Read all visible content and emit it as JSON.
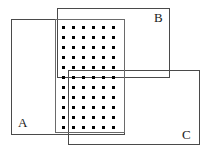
{
  "figure": {
    "width": 210,
    "height": 158,
    "background_color": "#ffffff",
    "stroke_color": "#4a4a4a",
    "dot_color": "#000000"
  },
  "rectangles": [
    {
      "id": "A",
      "label": "A",
      "x": 11,
      "y": 19,
      "width": 114,
      "height": 116,
      "label_x": 18,
      "label_y": 116
    },
    {
      "id": "B",
      "label": "B",
      "x": 57,
      "y": 8,
      "width": 113,
      "height": 70,
      "label_x": 154,
      "label_y": 11
    },
    {
      "id": "C",
      "label": "C",
      "x": 68,
      "y": 70,
      "width": 132,
      "height": 75,
      "label_x": 182,
      "label_y": 128
    }
  ],
  "dotted_region": {
    "id": "dot-region",
    "x": 55,
    "y": 19,
    "width": 70,
    "height": 114,
    "columns": 6,
    "rows": 11,
    "dot_size": 3,
    "dot_spacing_x": 10,
    "dot_spacing_y": 10,
    "offset_x": 6,
    "offset_y": 6
  }
}
